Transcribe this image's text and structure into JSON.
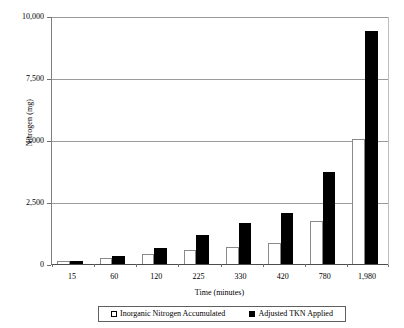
{
  "chart_data": {
    "type": "bar",
    "title": "",
    "xlabel": "Time (minutes)",
    "ylabel": "Nitrogen (mg)",
    "categories": [
      "15",
      "60",
      "120",
      "225",
      "330",
      "420",
      "780",
      "1,980"
    ],
    "series": [
      {
        "name": "Inorganic Nitrogen Accumulated",
        "style": "open",
        "swatch": "white-square-outline",
        "values": [
          110,
          240,
          400,
          560,
          700,
          850,
          1750,
          5040
        ]
      },
      {
        "name": "Adjusted TKN Applied",
        "style": "filled",
        "swatch": "black-square",
        "values": [
          130,
          330,
          660,
          1180,
          1660,
          2050,
          3720,
          9400
        ]
      }
    ],
    "ylim": [
      0,
      10000
    ],
    "yticks": [
      0,
      2500,
      5000,
      7500,
      10000
    ],
    "ytick_labels": [
      "0",
      "2,500",
      "5,000",
      "7,500",
      "10,000"
    ],
    "grid": "horizontal",
    "legend_position": "bottom"
  },
  "axes": {
    "y_title": "Nitrogen (mg)",
    "x_title": "Time (minutes)"
  },
  "legend": {
    "entries": [
      {
        "label": "Inorganic Nitrogen Accumulated"
      },
      {
        "label": "Adjusted TKN Applied"
      }
    ]
  }
}
